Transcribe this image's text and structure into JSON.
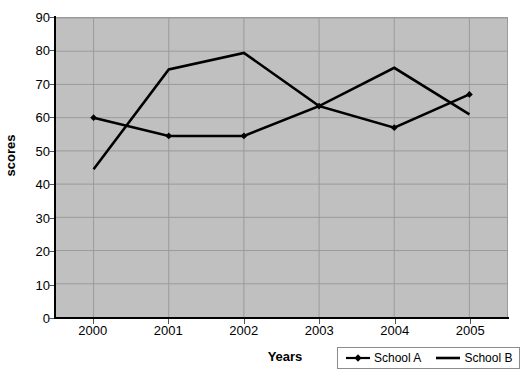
{
  "chart_data": {
    "type": "line",
    "title": "",
    "xlabel": "Years",
    "ylabel": "scores",
    "categories": [
      "2000",
      "2001",
      "2002",
      "2003",
      "2004",
      "2005"
    ],
    "series": [
      {
        "name": "School A",
        "values": [
          60,
          54.5,
          54.5,
          63.5,
          57,
          67
        ],
        "marker": "diamond",
        "color": "#000000"
      },
      {
        "name": "School B",
        "values": [
          44.5,
          74.5,
          79.5,
          63.5,
          75,
          61
        ],
        "marker": "none",
        "color": "#000000"
      }
    ],
    "ylim": [
      0,
      90
    ],
    "y_ticks": [
      "0",
      "10",
      "20",
      "30",
      "40",
      "50",
      "60",
      "70",
      "80",
      "90"
    ],
    "grid": true,
    "legend_position": "bottom-right",
    "plot_background": "#c0c0c0",
    "gridline_color": "#9a9a9a",
    "axis_color": "#000000"
  },
  "legend": {
    "entries": [
      {
        "label": "School A",
        "marker": "diamond-line-marker"
      },
      {
        "label": "School B",
        "marker": "plain-line-marker"
      }
    ]
  }
}
